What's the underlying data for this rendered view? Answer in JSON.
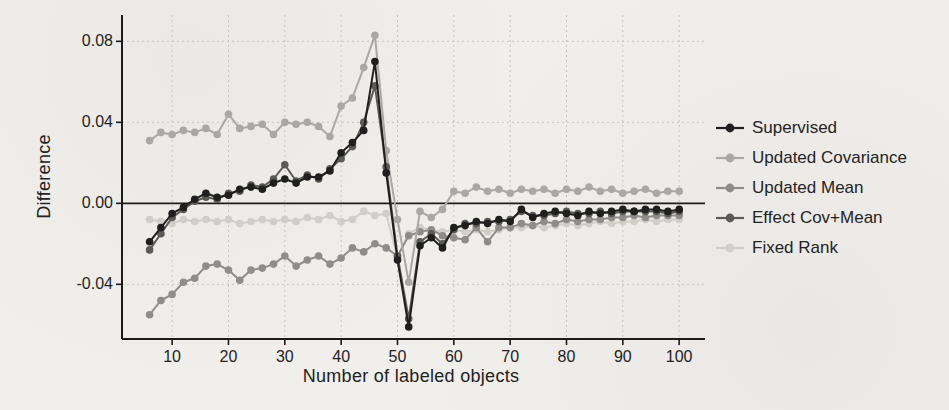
{
  "figure": {
    "ylabel": "Difference",
    "xlabel": "Number of labeled objects",
    "background_color": "#f1efec",
    "axis_color": "#1c1c1c",
    "grid_color": "#c6c4c0",
    "text_color": "#1e1e1e"
  },
  "chart_data": {
    "type": "line",
    "title": "",
    "xlabel": "Number of labeled objects",
    "ylabel": "Difference",
    "xlim": [
      1.1,
      103.7
    ],
    "ylim": [
      -0.067,
      0.093
    ],
    "x_ticks": [
      10,
      20,
      30,
      40,
      50,
      60,
      70,
      80,
      90,
      100
    ],
    "y_ticks": [
      {
        "label": "0.08",
        "value": 0.08
      },
      {
        "label": "0.04",
        "value": 0.04
      },
      {
        "label": "0.00",
        "value": 0.0
      },
      {
        "label": "-0.04",
        "value": -0.04
      }
    ],
    "grid": "dashed",
    "zero_line": true,
    "legend_position": "right",
    "marker": "circle",
    "x": [
      6,
      8,
      10,
      12,
      14,
      16,
      18,
      20,
      22,
      24,
      26,
      28,
      30,
      32,
      34,
      36,
      38,
      40,
      42,
      44,
      46,
      48,
      50,
      52,
      54,
      56,
      58,
      60,
      62,
      64,
      66,
      68,
      70,
      72,
      74,
      76,
      78,
      80,
      82,
      84,
      86,
      88,
      90,
      92,
      94,
      96,
      98,
      100
    ],
    "series": [
      {
        "name": "Supervised",
        "color": "#1f1f1f",
        "values": [
          -0.019,
          -0.012,
          -0.005,
          -0.002,
          0.002,
          0.005,
          0.003,
          0.004,
          0.007,
          0.008,
          0.007,
          0.01,
          0.012,
          0.01,
          0.013,
          0.013,
          0.016,
          0.025,
          0.03,
          0.036,
          0.07,
          0.015,
          -0.028,
          -0.061,
          -0.021,
          -0.017,
          -0.022,
          -0.012,
          -0.011,
          -0.009,
          -0.01,
          -0.008,
          -0.009,
          -0.003,
          -0.007,
          -0.005,
          -0.004,
          -0.005,
          -0.006,
          -0.004,
          -0.005,
          -0.004,
          -0.003,
          -0.004,
          -0.003,
          -0.003,
          -0.004,
          -0.003
        ]
      },
      {
        "name": "Updated Covariance",
        "color": "#a9a8a5",
        "values": [
          0.031,
          0.035,
          0.034,
          0.036,
          0.035,
          0.037,
          0.034,
          0.044,
          0.037,
          0.038,
          0.039,
          0.034,
          0.04,
          0.039,
          0.04,
          0.038,
          0.033,
          0.048,
          0.052,
          0.067,
          0.083,
          0.026,
          -0.008,
          -0.039,
          -0.004,
          -0.007,
          -0.003,
          0.006,
          0.005,
          0.008,
          0.006,
          0.007,
          0.005,
          0.007,
          0.006,
          0.007,
          0.005,
          0.007,
          0.006,
          0.008,
          0.006,
          0.007,
          0.005,
          0.006,
          0.007,
          0.005,
          0.006,
          0.006
        ]
      },
      {
        "name": "Updated Mean",
        "color": "#8e8d8b",
        "values": [
          -0.055,
          -0.048,
          -0.045,
          -0.039,
          -0.037,
          -0.031,
          -0.03,
          -0.033,
          -0.038,
          -0.033,
          -0.032,
          -0.03,
          -0.026,
          -0.031,
          -0.028,
          -0.026,
          -0.03,
          -0.027,
          -0.022,
          -0.024,
          -0.02,
          -0.022,
          -0.026,
          -0.016,
          -0.014,
          -0.013,
          -0.016,
          -0.017,
          -0.018,
          -0.012,
          -0.019,
          -0.012,
          -0.012,
          -0.01,
          -0.011,
          -0.009,
          -0.01,
          -0.008,
          -0.009,
          -0.008,
          -0.008,
          -0.007,
          -0.007,
          -0.006,
          -0.007,
          -0.006,
          -0.006,
          -0.006
        ]
      },
      {
        "name": "Effect Cov+Mean",
        "color": "#5a5a57",
        "values": [
          -0.023,
          -0.015,
          -0.007,
          -0.003,
          0.001,
          0.003,
          0.002,
          0.005,
          0.006,
          0.009,
          0.008,
          0.012,
          0.019,
          0.011,
          0.014,
          0.012,
          0.017,
          0.022,
          0.028,
          0.04,
          0.058,
          0.018,
          -0.026,
          -0.057,
          -0.019,
          -0.015,
          -0.02,
          -0.013,
          -0.01,
          -0.01,
          -0.009,
          -0.009,
          -0.008,
          -0.004,
          -0.006,
          -0.006,
          -0.005,
          -0.004,
          -0.005,
          -0.005,
          -0.004,
          -0.005,
          -0.004,
          -0.004,
          -0.004,
          -0.004,
          -0.005,
          -0.004
        ]
      },
      {
        "name": "Fixed Rank",
        "color": "#cfcec9",
        "values": [
          -0.008,
          -0.009,
          -0.01,
          -0.008,
          -0.009,
          -0.008,
          -0.009,
          -0.008,
          -0.01,
          -0.009,
          -0.008,
          -0.009,
          -0.008,
          -0.009,
          -0.007,
          -0.008,
          -0.006,
          -0.009,
          -0.008,
          -0.004,
          -0.006,
          -0.005,
          -0.027,
          -0.015,
          -0.012,
          -0.013,
          -0.014,
          -0.013,
          -0.014,
          -0.013,
          -0.014,
          -0.013,
          -0.012,
          -0.012,
          -0.011,
          -0.012,
          -0.011,
          -0.01,
          -0.011,
          -0.01,
          -0.009,
          -0.01,
          -0.009,
          -0.009,
          -0.008,
          -0.009,
          -0.008,
          -0.008
        ]
      }
    ]
  }
}
